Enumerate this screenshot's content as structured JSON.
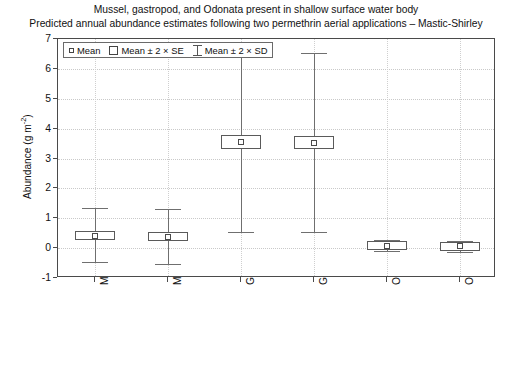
{
  "chart_data": {
    "type": "scatter",
    "title": "Mussel, gastropod, and Odonata present in shallow surface water body",
    "subtitle": "Predicted annual abundance estimates following two permethrin aerial applications – Mastic-Shirley",
    "xlabel": "",
    "ylabel": "Abundance (g m",
    "ylabel_sup": "-2",
    "ylabel_suffix": ")",
    "ylim": [
      -1,
      7
    ],
    "yticks": [
      "7",
      "6",
      "5",
      "4",
      "3",
      "2",
      "1",
      "0",
      "-1"
    ],
    "ytick_values": [
      7,
      6,
      5,
      4,
      3,
      2,
      1,
      0,
      -1
    ],
    "grid": true,
    "legend_position": "top-left-inside",
    "categories": [
      "Mussel (P)",
      "Mussel (C)",
      "Gastropod (P)",
      "Gastropod (C)",
      "Odonata (P)",
      "Odonata (C)"
    ],
    "series": [
      {
        "name": "Mean",
        "values": [
          0.42,
          0.38,
          3.55,
          3.53,
          0.08,
          0.06
        ]
      },
      {
        "name": "Mean ± 2 × SE",
        "lower": [
          0.3,
          0.26,
          3.33,
          3.31,
          0.01,
          -0.01
        ],
        "upper": [
          0.55,
          0.5,
          3.78,
          3.76,
          0.15,
          0.13
        ]
      },
      {
        "name": "Mean ± 2 × SD",
        "lower": [
          -0.48,
          -0.52,
          0.55,
          0.55,
          -0.1,
          -0.12
        ],
        "upper": [
          1.34,
          1.3,
          6.55,
          6.52,
          0.26,
          0.24
        ]
      }
    ],
    "legend": [
      {
        "label": "Mean",
        "marker": "small-square"
      },
      {
        "label": "Mean ± 2 × SE",
        "marker": "box"
      },
      {
        "label": "Mean ± 2 × SD",
        "marker": "i-bar"
      }
    ]
  }
}
